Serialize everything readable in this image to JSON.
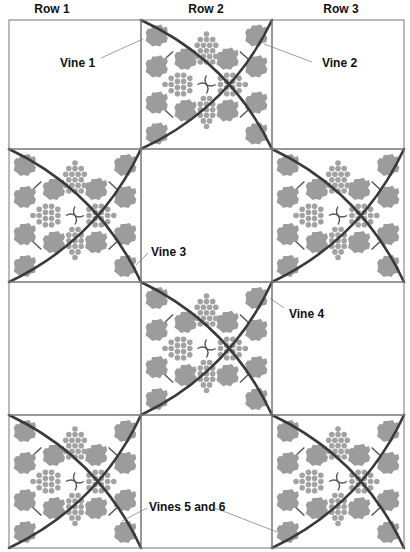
{
  "column_headers": [
    "Row 1",
    "Row 2",
    "Row 3"
  ],
  "callouts": [
    {
      "id": "vine-1",
      "text": "Vine 1"
    },
    {
      "id": "vine-2",
      "text": "Vine 2"
    },
    {
      "id": "vine-3",
      "text": "Vine 3"
    },
    {
      "id": "vine-4",
      "text": "Vine 4"
    },
    {
      "id": "vines-5-6",
      "text": "Vines 5 and 6"
    }
  ],
  "grid": {
    "columns": 3,
    "rows": 4,
    "decorated_tiles": [
      {
        "row": 1,
        "col": 2
      },
      {
        "row": 2,
        "col": 1
      },
      {
        "row": 2,
        "col": 3
      },
      {
        "row": 3,
        "col": 2
      },
      {
        "row": 4,
        "col": 1
      },
      {
        "row": 4,
        "col": 3
      }
    ]
  },
  "colors": {
    "vine": "#3a3a3a",
    "leaf": "#9c9c9c",
    "grid_line": "#777777"
  }
}
